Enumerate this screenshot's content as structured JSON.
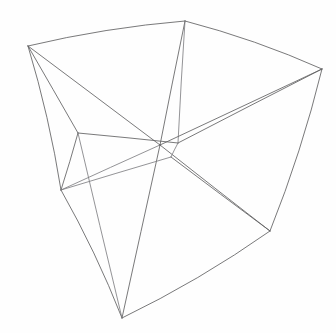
{
  "figure": {
    "width": 336,
    "height": 333,
    "background_color": "#fefefe",
    "stroke_color": "#5e5e60",
    "stroke_color_light": "#76767a",
    "stroke_color_dark": "#4d4d50",
    "stroke_width": 0.85
  },
  "chart_data": {
    "type": "diagram",
    "subtype": "wireframe-polyhedron",
    "coordinate_space": {
      "x": [
        0,
        336
      ],
      "y": [
        0,
        333
      ],
      "origin": "top-left"
    },
    "vertices": [
      {
        "id": "A",
        "name": "top-left-corner",
        "x": 28,
        "y": 46
      },
      {
        "id": "B",
        "name": "top-back-corner",
        "x": 185,
        "y": 21
      },
      {
        "id": "C",
        "name": "top-right-corner",
        "x": 322,
        "y": 69
      },
      {
        "id": "D",
        "name": "inner-left-corner",
        "x": 78,
        "y": 133
      },
      {
        "id": "E",
        "name": "center-convergence",
        "x": 160,
        "y": 145
      },
      {
        "id": "F",
        "name": "inner-right-corner",
        "x": 178,
        "y": 143
      },
      {
        "id": "G",
        "name": "inner-lower-corner",
        "x": 171,
        "y": 157
      },
      {
        "id": "H",
        "name": "left-mid-corner",
        "x": 61,
        "y": 190
      },
      {
        "id": "I",
        "name": "bottom-right-corner",
        "x": 270,
        "y": 231
      },
      {
        "id": "J",
        "name": "bottom-apex-corner",
        "x": 122,
        "y": 318
      }
    ],
    "edges": [
      {
        "name": "top-left-to-top-back",
        "from": "A",
        "to": "B",
        "curve": "bowed-up",
        "weight": "normal"
      },
      {
        "name": "top-back-to-top-right",
        "from": "B",
        "to": "C",
        "curve": "bowed-up",
        "weight": "normal"
      },
      {
        "name": "top-left-to-left-mid",
        "from": "A",
        "to": "H",
        "curve": "bowed-left",
        "weight": "normal"
      },
      {
        "name": "left-mid-to-bottom-apex",
        "from": "H",
        "to": "J",
        "curve": "bowed-left",
        "weight": "normal"
      },
      {
        "name": "top-right-to-bottom-right",
        "from": "C",
        "to": "I",
        "curve": "bowed-right",
        "weight": "normal"
      },
      {
        "name": "bottom-right-to-apex",
        "from": "I",
        "to": "J",
        "curve": "bowed-down",
        "weight": "normal"
      },
      {
        "name": "top-left-to-inner-left",
        "from": "A",
        "to": "D",
        "curve": "straight",
        "weight": "normal"
      },
      {
        "name": "inner-left-to-inner-right",
        "from": "D",
        "to": "F",
        "curve": "straight",
        "weight": "normal"
      },
      {
        "name": "inner-right-to-top-right",
        "from": "F",
        "to": "C",
        "curve": "straight",
        "weight": "normal"
      },
      {
        "name": "inner-left-to-left-mid",
        "from": "D",
        "to": "H",
        "curve": "straight",
        "weight": "normal"
      },
      {
        "name": "inner-lower-to-bottom-right",
        "from": "G",
        "to": "I",
        "curve": "straight",
        "weight": "normal"
      },
      {
        "name": "left-mid-to-center",
        "from": "H",
        "to": "E",
        "curve": "straight",
        "weight": "light"
      },
      {
        "name": "top-left-to-center",
        "from": "A",
        "to": "E",
        "curve": "straight",
        "weight": "normal"
      },
      {
        "name": "top-back-to-center-a",
        "from": "B",
        "to": "E",
        "curve": "straight",
        "weight": "normal"
      },
      {
        "name": "top-back-to-center-b",
        "from": "B",
        "to": "F",
        "curve": "straight",
        "weight": "light"
      },
      {
        "name": "top-right-to-center",
        "from": "C",
        "to": "E",
        "curve": "straight",
        "weight": "normal"
      },
      {
        "name": "center-to-bottom-apex",
        "from": "E",
        "to": "J",
        "curve": "straight",
        "weight": "normal"
      },
      {
        "name": "center-to-bottom-right",
        "from": "E",
        "to": "I",
        "curve": "straight",
        "weight": "normal"
      },
      {
        "name": "inner-right-to-inner-lower",
        "from": "F",
        "to": "G",
        "curve": "straight",
        "weight": "light"
      },
      {
        "name": "inner-left-to-bottom-apex",
        "from": "D",
        "to": "J",
        "curve": "straight",
        "weight": "light"
      },
      {
        "name": "left-mid-to-center-lower",
        "from": "H",
        "to": "G",
        "curve": "straight",
        "weight": "light"
      }
    ],
    "edge_count": 21,
    "vertex_count": 10
  }
}
